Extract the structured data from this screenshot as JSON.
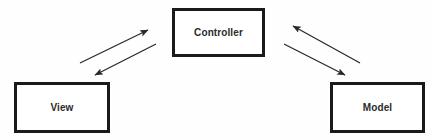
{
  "diagram": {
    "background_color": "#fefefe",
    "node_fill_color": "#ffffff",
    "node_border_color": "#1a1a1a",
    "edge_color": "#2a2a2a",
    "label_color": "#2b2b2b",
    "nodes": [
      {
        "id": "controller",
        "label": "Controller",
        "x": 172,
        "y": 8,
        "width": 93,
        "height": 49
      },
      {
        "id": "view",
        "label": "View",
        "x": 14,
        "y": 82,
        "width": 96,
        "height": 51
      },
      {
        "id": "model",
        "label": "Model",
        "x": 330,
        "y": 82,
        "width": 95,
        "height": 51
      }
    ],
    "edges": [
      {
        "id": "view-to-controller",
        "from": "view",
        "to": "controller",
        "label": "",
        "direction": "up-right",
        "x1": 80,
        "y1": 63,
        "x2": 148,
        "y2": 30
      },
      {
        "id": "controller-to-view",
        "from": "controller",
        "to": "view",
        "label": "",
        "direction": "down-left",
        "x1": 156,
        "y1": 44,
        "x2": 95,
        "y2": 75
      },
      {
        "id": "model-to-controller",
        "from": "model",
        "to": "controller",
        "label": "",
        "direction": "up-left",
        "x1": 360,
        "y1": 63,
        "x2": 293,
        "y2": 26
      },
      {
        "id": "controller-to-model",
        "from": "controller",
        "to": "model",
        "label": "",
        "direction": "down-right",
        "x1": 284,
        "y1": 44,
        "x2": 345,
        "y2": 75
      }
    ]
  }
}
